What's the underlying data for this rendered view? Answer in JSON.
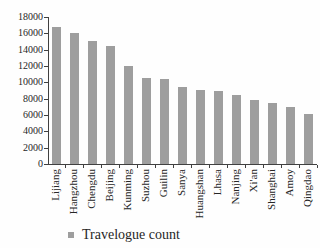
{
  "chart_data": {
    "type": "bar",
    "categories": [
      "Lijiang",
      "Hangzhou",
      "Chengdu",
      "Beijing",
      "Kunming",
      "Suzhou",
      "Guilin",
      "Sanya",
      "Huangshan",
      "Lhasa",
      "Nanjing",
      "Xi'an",
      "Shanghai",
      "Amoy",
      "Qingdao"
    ],
    "values": [
      16800,
      16100,
      15000,
      14500,
      12000,
      10500,
      10400,
      9400,
      9100,
      8900,
      8500,
      7800,
      7500,
      7000,
      6100
    ],
    "title": "",
    "xlabel": "",
    "ylabel": "",
    "ylim": [
      0,
      18000
    ],
    "ytick_step": 2000,
    "grid": false,
    "legend": {
      "label": "Travelogue count",
      "position": "bottom-left"
    },
    "colors": {
      "bar": "#9e9e9e",
      "axis": "#404040",
      "text": "#262626",
      "background": "#fefefe"
    }
  }
}
